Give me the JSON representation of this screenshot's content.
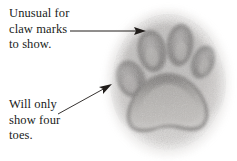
{
  "figure": {
    "background_color": "#ffffff",
    "width": 237,
    "height": 161
  },
  "annotations": [
    {
      "id": "claw-marks",
      "lines": [
        "Unusual for",
        "claw marks",
        "to show."
      ],
      "text": "Unusual for claw marks to show.",
      "color": "#201c1a",
      "leader": {
        "style": "straight-arrow",
        "from": [
          70,
          31
        ],
        "to": [
          146,
          31
        ],
        "arrow_at": "end"
      }
    },
    {
      "id": "four-toes",
      "lines": [
        "Will only",
        "show four",
        "toes."
      ],
      "text": "Will only show four toes.",
      "color": "#201c1a",
      "leader": {
        "style": "straight-arrow",
        "from": [
          58,
          114
        ],
        "to": [
          112,
          84
        ],
        "arrow_at": "end"
      }
    }
  ],
  "illustration": {
    "name": "paw-print",
    "subject": "animal track with four toe pads and one heel pad",
    "medium": "grainy grayscale pencil / impression",
    "colors": {
      "print_light": "#d8d5d2",
      "print_mid": "#a8a5a3",
      "print_dark": "#6f6c6b",
      "pad_dark": "#4a4746",
      "pad_core": "#8d8a89",
      "ink": "#201c1a"
    },
    "toe_pads": [
      {
        "id": "toe-1-outer-left",
        "cx": 131,
        "cy": 79,
        "rx": 14,
        "ry": 19,
        "rotate": -24
      },
      {
        "id": "toe-2-inner-left",
        "cx": 152,
        "cy": 51,
        "rx": 14,
        "ry": 21,
        "rotate": -10
      },
      {
        "id": "toe-3-inner-right",
        "cx": 180,
        "cy": 45,
        "rx": 13,
        "ry": 21,
        "rotate": 6
      },
      {
        "id": "toe-4-outer-right",
        "cx": 203,
        "cy": 62,
        "rx": 11,
        "ry": 17,
        "rotate": 22
      }
    ],
    "heel_pad": {
      "id": "heel-pad",
      "cx": 170,
      "cy": 104,
      "rx": 42,
      "ry": 31,
      "lobes": 3
    },
    "print_body": {
      "cx": 168,
      "cy": 82,
      "rx": 58,
      "ry": 70
    }
  }
}
